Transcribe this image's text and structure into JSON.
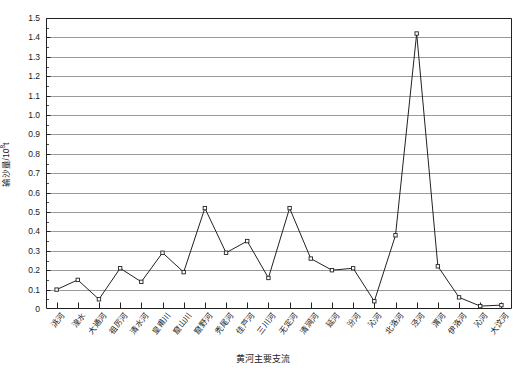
{
  "chart_data": {
    "type": "line",
    "title": "",
    "xlabel": "黄河主要支流",
    "ylabel": "输沙量/10",
    "ylabel_sup": "8",
    "ylabel_unit": "t",
    "ylim": [
      0,
      1.5
    ],
    "ytick_step": 0.1,
    "grid": "horizontal",
    "legend": "none",
    "marker": "open-square",
    "line_color": "#222222",
    "grid_color": "#808080",
    "categories": [
      "洮河",
      "湟水",
      "大通河",
      "祖厉河",
      "清水河",
      "皇甫川",
      "窟山川",
      "窟野河",
      "秃尾河",
      "佳芦河",
      "三川河",
      "无定河",
      "清涧河",
      "延河",
      "汾河",
      "沁河",
      "北洛河",
      "泾河",
      "渭河",
      "伊洛河",
      "沁河",
      "大汶河"
    ],
    "values": [
      0.1,
      0.15,
      0.05,
      0.21,
      0.14,
      0.29,
      0.19,
      0.52,
      0.29,
      0.35,
      0.16,
      0.52,
      0.26,
      0.2,
      0.21,
      0.04,
      0.38,
      1.42,
      0.22,
      0.06,
      0.015,
      0.02
    ],
    "ytick_labels": [
      "0",
      "0.1",
      "0.2",
      "0.3",
      "0.4",
      "0.5",
      "0.6",
      "0.7",
      "0.8",
      "0.9",
      "1.0",
      "1.1",
      "1.2",
      "1.3",
      "1.4",
      "1.5"
    ],
    "ytick_values": [
      0,
      0.1,
      0.2,
      0.3,
      0.4,
      0.5,
      0.6,
      0.7,
      0.8,
      0.9,
      1.0,
      1.1,
      1.2,
      1.3,
      1.4,
      1.5
    ]
  }
}
